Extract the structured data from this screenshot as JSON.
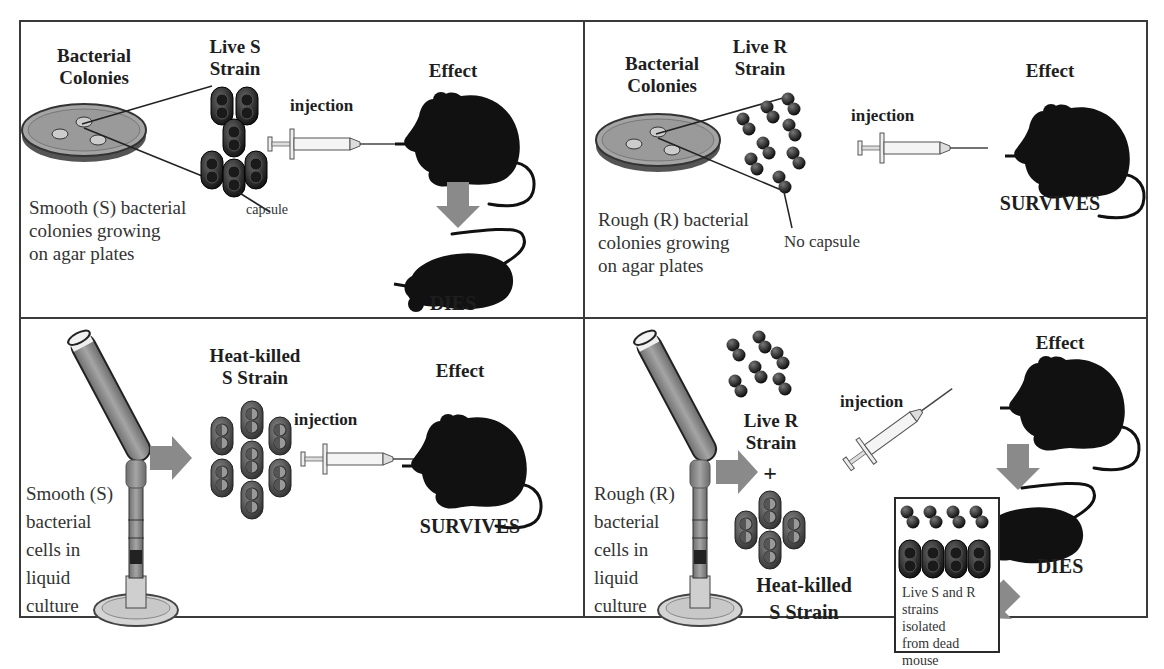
{
  "colors": {
    "border": "#3a3a3a",
    "arrow": "#8a8a8a",
    "mouse": "#111111",
    "bacteria": "#1c1c1c",
    "capsule": "#3c3c3c",
    "agar": "#9a9a9a",
    "tube_liquid": "#8c8c8c"
  },
  "panels": {
    "top_left": {
      "colonies_label": "Bacterial Colonies",
      "colonies_line1": "Bacterial",
      "colonies_line2": "Colonies",
      "strain_line1": "Live S",
      "strain_line2": "Strain",
      "capsule_label": "capsule",
      "injection_label": "injection",
      "effect_label": "Effect",
      "outcome": "DIES",
      "description": [
        "Smooth (S) bacterial",
        "colonies growing",
        "on agar plates"
      ]
    },
    "top_right": {
      "colonies_line1": "Bacterial",
      "colonies_line2": "Colonies",
      "strain_line1": "Live R",
      "strain_line2": "Strain",
      "capsule_label": "No capsule",
      "injection_label": "injection",
      "effect_label": "Effect",
      "outcome": "SURVIVES",
      "description": [
        "Rough (R) bacterial",
        "colonies growing",
        "on agar plates"
      ]
    },
    "bottom_left": {
      "strain_line1": "Heat-killed",
      "strain_line2": "S Strain",
      "injection_label": "injection",
      "effect_label": "Effect",
      "outcome": "SURVIVES",
      "description": [
        "Smooth (S)",
        "bacterial",
        "cells in",
        "liquid",
        "culture"
      ]
    },
    "bottom_right": {
      "live_line1": "Live R",
      "live_line2": "Strain",
      "plus": "+",
      "heat_line1": "Heat-killed",
      "heat_line2": "S Strain",
      "injection_label": "injection",
      "effect_label": "Effect",
      "outcome": "DIES",
      "description": [
        "Rough (R)",
        "bacterial",
        "cells in",
        "liquid",
        "culture"
      ],
      "isolated_text": [
        "Live S and R",
        "strains",
        "isolated",
        "from dead",
        "mouse"
      ]
    }
  }
}
